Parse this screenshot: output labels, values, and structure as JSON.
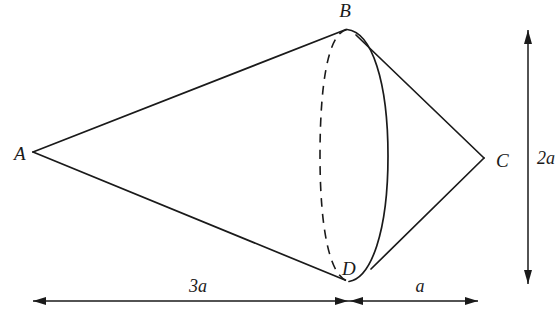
{
  "figure": {
    "background_color": "#ffffff",
    "stroke_color": "#1a1a1a",
    "vertices": [
      {
        "id": "A",
        "label": "A",
        "role": "left-cone-apex",
        "x": 33,
        "y": 152,
        "label_x": 14,
        "label_y": 160
      },
      {
        "id": "B",
        "label": "B",
        "role": "base-circle-top",
        "x": 348,
        "y": 29,
        "label_x": 345,
        "label_y": 17
      },
      {
        "id": "C",
        "label": "C",
        "role": "right-cone-apex",
        "x": 484,
        "y": 158,
        "label_x": 496,
        "label_y": 167
      },
      {
        "id": "D",
        "label": "D",
        "role": "base-circle-bottom",
        "x": 348,
        "y": 280,
        "label_x": 342,
        "label_y": 275
      }
    ],
    "base_circle": {
      "center_x": 354,
      "center_y": 155,
      "semi_width": 34,
      "semi_height": 126,
      "front_arc_style": "solid",
      "back_arc_style": "dashed"
    },
    "edges": [
      {
        "from": "A",
        "to": "B",
        "style": "solid"
      },
      {
        "from": "A",
        "to": "D",
        "style": "solid"
      },
      {
        "from": "B",
        "to": "C",
        "style": "solid"
      },
      {
        "from": "D",
        "to": "C",
        "style": "solid"
      }
    ],
    "dimensions": [
      {
        "id": "horizontal-left",
        "label": "3a",
        "value_expression": "3a",
        "orientation": "horizontal",
        "from_x": 33,
        "to_x": 348,
        "y": 301,
        "label_x": 198,
        "label_y": 292,
        "arrows": "both"
      },
      {
        "id": "horizontal-right",
        "label": "a",
        "value_expression": "a",
        "orientation": "horizontal",
        "from_x": 348,
        "to_x": 478,
        "y": 301,
        "label_x": 420,
        "label_y": 292,
        "arrows": "both"
      },
      {
        "id": "vertical-height",
        "label": "2a",
        "value_expression": "2a",
        "orientation": "vertical",
        "x": 528,
        "from_y": 30,
        "to_y": 284,
        "label_x": 537,
        "label_y": 164,
        "arrows": "both"
      }
    ]
  }
}
